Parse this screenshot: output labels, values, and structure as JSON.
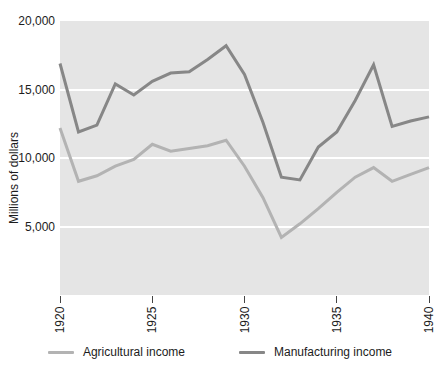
{
  "chart_data": {
    "type": "line",
    "title": "",
    "xlabel": "",
    "ylabel": "Millions of dollars",
    "x": [
      1920,
      1921,
      1922,
      1923,
      1924,
      1925,
      1926,
      1927,
      1928,
      1929,
      1930,
      1931,
      1932,
      1933,
      1934,
      1935,
      1936,
      1937,
      1938,
      1939,
      1940
    ],
    "series": [
      {
        "name": "Agricultural income",
        "color": "#b3b3b3",
        "values": [
          12200,
          8300,
          8700,
          9400,
          9900,
          11000,
          10500,
          10700,
          10900,
          11300,
          9400,
          7100,
          4200,
          5200,
          6300,
          7500,
          8600,
          9300,
          8300,
          8800,
          9300
        ]
      },
      {
        "name": "Manufacturing income",
        "color": "#878787",
        "values": [
          16900,
          11900,
          12400,
          15400,
          14600,
          15600,
          16200,
          16300,
          17200,
          18200,
          16100,
          12600,
          8600,
          8400,
          10800,
          11900,
          14200,
          16800,
          12300,
          12700,
          13000
        ]
      }
    ],
    "xlim": [
      1920,
      1940
    ],
    "ylim": [
      0,
      20000
    ],
    "y_ticks": [
      {
        "value": 5000,
        "label": "5,000"
      },
      {
        "value": 10000,
        "label": "10,000"
      },
      {
        "value": 15000,
        "label": "15,000"
      },
      {
        "value": 20000,
        "label": "20,000"
      }
    ],
    "x_ticks": [
      {
        "value": 1920,
        "label": "1920"
      },
      {
        "value": 1925,
        "label": "1925"
      },
      {
        "value": 1930,
        "label": "1930"
      },
      {
        "value": 1935,
        "label": "1935"
      },
      {
        "value": 1940,
        "label": "1940"
      }
    ],
    "grid": "horizontal white gridlines at 5,000 / 10,000 / 15,000",
    "legend_position": "bottom",
    "plot_bg": "#e5e5e5",
    "grid_color": "#ffffff",
    "text_color": "#1c1c1c"
  }
}
